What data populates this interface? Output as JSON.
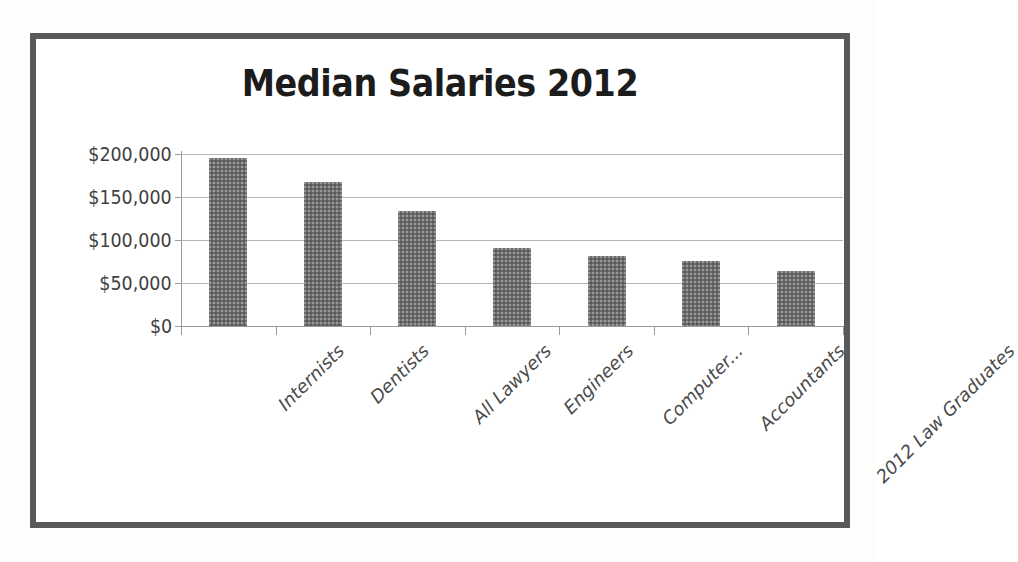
{
  "chart_data": {
    "type": "bar",
    "title": "Median Salaries 2012",
    "xlabel": "",
    "ylabel": "",
    "categories": [
      "Internists",
      "Dentists",
      "All Lawyers",
      "Engineers",
      "Computer...",
      "Accountants",
      "2012 Law Graduates"
    ],
    "values": [
      195000,
      168000,
      134000,
      91000,
      81000,
      76000,
      64000
    ],
    "ylim": [
      0,
      200000
    ],
    "ytick_values": [
      200000,
      150000,
      100000,
      50000,
      0
    ],
    "ytick_labels": [
      "$200,000",
      "$150,000",
      "$100,000",
      "$50,000",
      "$0"
    ],
    "grid": true,
    "legend": false,
    "series": [
      {
        "name": "Median Salary",
        "values": [
          195000,
          168000,
          134000,
          91000,
          81000,
          76000,
          64000
        ]
      }
    ],
    "colors": {
      "bar_fill": "#6e6e6e",
      "gridline": "#b4b4b4",
      "axis_line": "#9a9a9a",
      "title_text": "#1c1c1c",
      "tick_text": "#3f3f3f",
      "category_text": "#4a4a4a",
      "frame_border": "#595959",
      "background": "#ffffff"
    }
  }
}
